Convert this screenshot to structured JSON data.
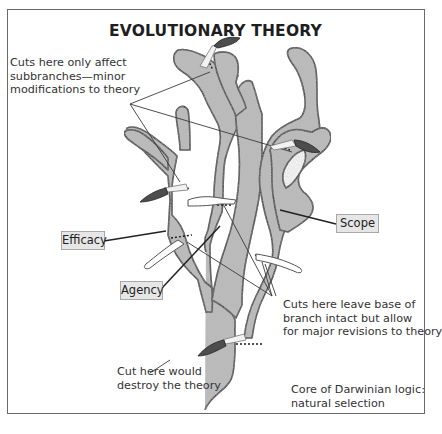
{
  "figure": {
    "title": "EVOLUTIONARY THEORY",
    "annotations": {
      "subbranch_note": [
        "Cuts here only affect",
        "subbranches—minor",
        "modifications to theory"
      ],
      "branch_note": [
        "Cuts here leave base of",
        "branch intact but allow",
        "for major revisions to theory"
      ],
      "trunk_note": [
        "Cut here would",
        "destroy the theory"
      ],
      "core_note": [
        "Core of Darwinian logic:",
        "natural selection"
      ]
    },
    "labels": {
      "efficacy": "Efficacy",
      "agency": "Agency",
      "scope": "Scope"
    },
    "icons": {
      "knife": "knife-icon",
      "cut_line": "dotted-cut-line"
    },
    "colors": {
      "tree_fill": "#b8b8b8",
      "tree_outline": "#2a2a2a",
      "label_bg": "#e6e6e6",
      "knife_handle": "#4a4a4a",
      "frame": "#6a6a6a"
    }
  }
}
